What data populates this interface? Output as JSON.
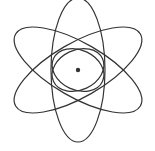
{
  "image": {
    "subject": "atom-icon",
    "stroke_color": "#333333",
    "background": "#ffffff",
    "nucleus_color": "#333333"
  }
}
